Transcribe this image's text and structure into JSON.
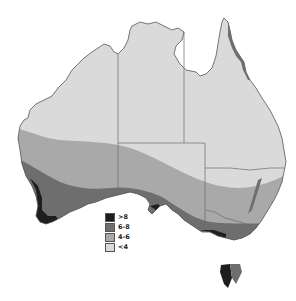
{
  "map": {
    "region": "Australia",
    "colors": {
      "background": "#ffffff",
      "outline": "#555555",
      "state_borders": "#6a6a6a"
    }
  },
  "legend": {
    "items": [
      {
        "label": ">8",
        "color": "#1e1e1e"
      },
      {
        "label": "6-8",
        "color": "#6e6e6e"
      },
      {
        "label": "4-6",
        "color": "#a9a9a9"
      },
      {
        "label": "<4",
        "color": "#dadada"
      }
    ]
  }
}
